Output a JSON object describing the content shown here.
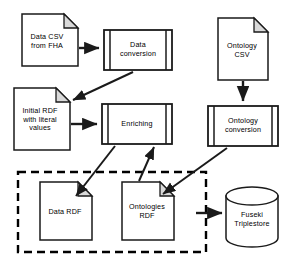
{
  "diagram": {
    "colors": {
      "stroke": "#1a1a1a",
      "fill": "#ffffff",
      "fold_fill": "#d9d9d9",
      "boundary": "#000000"
    },
    "nodes": [
      {
        "id": "data-csv",
        "shape": "document",
        "label": "Data CSV\nfrom FHA",
        "x": 22,
        "y": 14,
        "w": 56,
        "h": 52
      },
      {
        "id": "data-conversion",
        "shape": "predefined-process",
        "label": "Data\nconversion",
        "x": 104,
        "y": 30,
        "w": 68,
        "h": 40
      },
      {
        "id": "ontology-csv",
        "shape": "document",
        "label": "Ontology\nCSV",
        "x": 218,
        "y": 18,
        "w": 50,
        "h": 62
      },
      {
        "id": "initial-rdf",
        "shape": "document",
        "label": "Initial RDF\nwith literal\nvalues",
        "x": 14,
        "y": 88,
        "w": 56,
        "h": 62
      },
      {
        "id": "enriching",
        "shape": "predefined-process",
        "label": "Enriching",
        "x": 102,
        "y": 104,
        "w": 70,
        "h": 40
      },
      {
        "id": "ontology-conversion",
        "shape": "predefined-process",
        "label": "Ontology\nconversion",
        "x": 208,
        "y": 106,
        "w": 70,
        "h": 40
      },
      {
        "id": "data-rdf",
        "shape": "document",
        "label": "Data RDF",
        "x": 40,
        "y": 182,
        "w": 52,
        "h": 58
      },
      {
        "id": "ontologies-rdf",
        "shape": "document",
        "label": "Ontologies\nRDF",
        "x": 122,
        "y": 182,
        "w": 52,
        "h": 58
      },
      {
        "id": "fuseki-triplestore",
        "shape": "cylinder",
        "label": "Fuseki\nTriplestore",
        "x": 226,
        "y": 186,
        "w": 52,
        "h": 62
      }
    ],
    "boundary": {
      "id": "rdf-store-boundary",
      "style": "dashed",
      "x": 18,
      "y": 172,
      "w": 188,
      "h": 80
    },
    "edges": [
      {
        "id": "csv-to-conversion",
        "from": "data-csv",
        "to": "data-conversion",
        "style": "solid",
        "arrow": "end"
      },
      {
        "id": "conversion-to-initial",
        "from": "data-conversion",
        "to": "initial-rdf",
        "style": "solid",
        "arrow": "end"
      },
      {
        "id": "initial-to-enriching",
        "from": "initial-rdf",
        "to": "enriching",
        "style": "solid",
        "arrow": "end"
      },
      {
        "id": "ontologycsv-to-ontconv",
        "from": "ontology-csv",
        "to": "ontology-conversion",
        "style": "solid",
        "arrow": "end"
      },
      {
        "id": "enriching-to-datardf",
        "from": "enriching",
        "to": "data-rdf",
        "style": "solid",
        "arrow": "end"
      },
      {
        "id": "ontologiesrdf-to-enrich",
        "from": "ontologies-rdf",
        "to": "enriching",
        "style": "solid",
        "arrow": "end"
      },
      {
        "id": "ontconv-to-ontologiesrdf",
        "from": "ontology-conversion",
        "to": "ontologies-rdf",
        "style": "solid",
        "arrow": "end"
      },
      {
        "id": "ontologiesrdf-to-fuseki",
        "from": "ontologies-rdf",
        "to": "fuseki-triplestore",
        "style": "solid",
        "arrow": "end"
      }
    ]
  }
}
